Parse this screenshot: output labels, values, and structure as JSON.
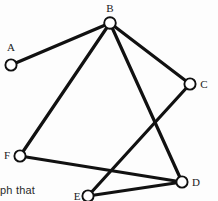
{
  "figure": {
    "type": "undirected-graph-diagram",
    "background_color": "#fdfdfd",
    "edge_color": "#111111",
    "node_fill_color": "#ffffff",
    "node_stroke_color": "#101010",
    "label_color": "#1a1a1a"
  },
  "caption": {
    "fragment_text": "ph that"
  },
  "chart_data": {
    "type": "diagram",
    "title": "",
    "nodes": [
      {
        "id": "A",
        "label": "A",
        "cx": 11,
        "cy": 65,
        "r": 5.6,
        "label_x": 11,
        "label_y": 48
      },
      {
        "id": "B",
        "label": "B",
        "cx": 110,
        "cy": 23,
        "r": 5.8,
        "label_x": 110,
        "label_y": 9
      },
      {
        "id": "C",
        "label": "C",
        "cx": 190,
        "cy": 84,
        "r": 5.6,
        "label_x": 204,
        "label_y": 85
      },
      {
        "id": "D",
        "label": "D",
        "cx": 182,
        "cy": 182,
        "r": 5.6,
        "label_x": 196,
        "label_y": 183
      },
      {
        "id": "E",
        "label": "E",
        "cx": 88,
        "cy": 196,
        "r": 5.6,
        "label_x": 77,
        "label_y": 197
      },
      {
        "id": "F",
        "label": "F",
        "cx": 20,
        "cy": 156,
        "r": 5.6,
        "label_x": 7,
        "label_y": 156
      }
    ],
    "edges": [
      {
        "from": "A",
        "to": "B"
      },
      {
        "from": "B",
        "to": "C"
      },
      {
        "from": "B",
        "to": "D"
      },
      {
        "from": "B",
        "to": "F"
      },
      {
        "from": "C",
        "to": "E"
      },
      {
        "from": "F",
        "to": "D"
      },
      {
        "from": "E",
        "to": "D"
      }
    ],
    "node_count": 6,
    "edge_count": 7,
    "degrees": {
      "A": 1,
      "B": 4,
      "C": 2,
      "D": 3,
      "E": 2,
      "F": 2
    }
  }
}
